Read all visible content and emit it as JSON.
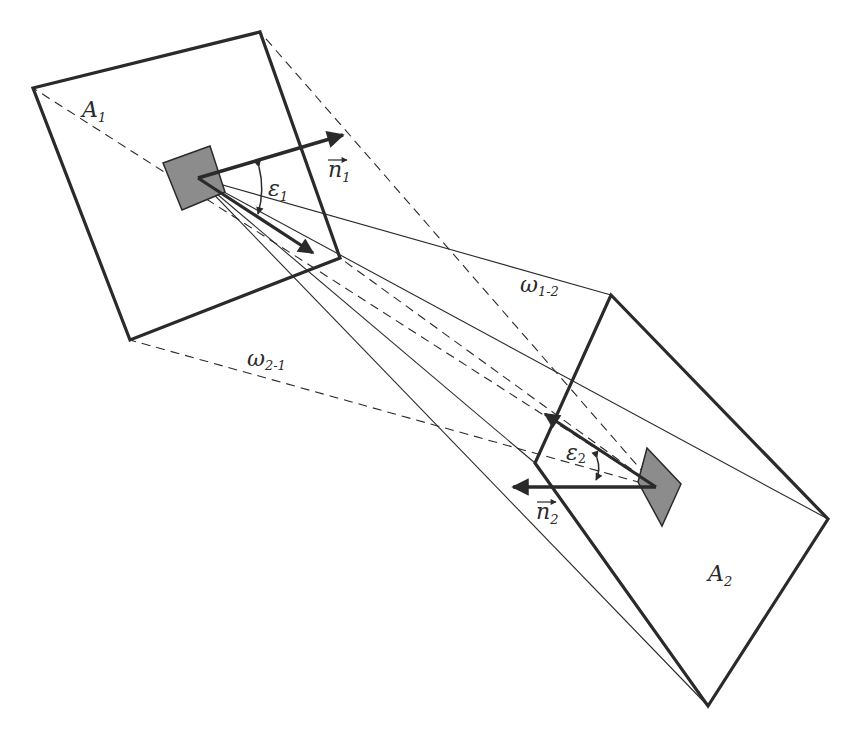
{
  "diagram": {
    "type": "view-factor geometry between two surfaces",
    "colors": {
      "line": "#2a2a2a",
      "element_fill": "#8c8c8c",
      "background": "#ffffff"
    },
    "surfaces": [
      {
        "id": "A1",
        "label": "A",
        "subscript": "1"
      },
      {
        "id": "A2",
        "label": "A",
        "subscript": "2"
      }
    ],
    "normals": [
      {
        "id": "n1",
        "label": "n",
        "subscript": "1"
      },
      {
        "id": "n2",
        "label": "n",
        "subscript": "2"
      }
    ],
    "angles": [
      {
        "id": "eps1",
        "label": "ε",
        "subscript": "1"
      },
      {
        "id": "eps2",
        "label": "ε",
        "subscript": "2"
      }
    ],
    "solid_angles": [
      {
        "id": "w12",
        "label": "ω",
        "subscript": "1-2"
      },
      {
        "id": "w21",
        "label": "ω",
        "subscript": "2-1"
      }
    ]
  }
}
